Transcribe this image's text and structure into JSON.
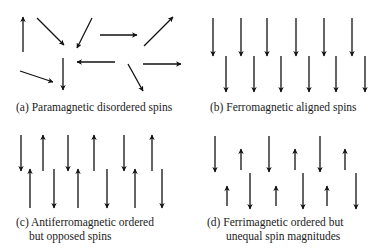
{
  "figure": {
    "panels": [
      {
        "id": "a",
        "caption_lines": [
          "(a) Paramagnetic disordered spins"
        ],
        "ordering": "disordered",
        "spins": [
          {
            "direction": "up"
          },
          {
            "direction": "down-right"
          },
          {
            "direction": "down-left"
          },
          {
            "direction": "right"
          },
          {
            "direction": "up-right"
          },
          {
            "direction": "down"
          },
          {
            "direction": "left"
          },
          {
            "direction": "right"
          },
          {
            "direction": "down-right"
          },
          {
            "direction": "down-right"
          }
        ]
      },
      {
        "id": "b",
        "caption_lines": [
          "(b) Ferromagnetic aligned spins"
        ],
        "ordering": "aligned",
        "rows": [
          {
            "spins": [
              "down",
              "down",
              "down",
              "down",
              "down",
              "down"
            ],
            "magnitude": "large"
          },
          {
            "spins": [
              "down",
              "down",
              "down",
              "down",
              "down",
              "down"
            ],
            "magnitude": "large"
          }
        ]
      },
      {
        "id": "c",
        "caption_lines": [
          "(c) Antiferromagnetic ordered",
          "but opposed spins"
        ],
        "ordering": "opposed",
        "rows": [
          {
            "spins": [
              "down",
              "up",
              "down",
              "up",
              "down",
              "up"
            ],
            "magnitude": "equal"
          },
          {
            "spins": [
              "up",
              "down",
              "up",
              "down",
              "up",
              "down"
            ],
            "magnitude": "equal"
          }
        ]
      },
      {
        "id": "d",
        "caption_lines": [
          "(d) Ferrimagnetic ordered but",
          "unequal spin magnitudes"
        ],
        "ordering": "opposed-unequal",
        "rows": [
          {
            "spins": [
              "down",
              "up-small",
              "down",
              "up-small",
              "down",
              "up-small"
            ]
          },
          {
            "spins": [
              "up-small",
              "down",
              "up-small",
              "down",
              "up-small",
              "down"
            ]
          }
        ]
      }
    ],
    "colors": {
      "arrow": "#111111",
      "text": "#1a1a1a",
      "background": "#ffffff"
    }
  }
}
